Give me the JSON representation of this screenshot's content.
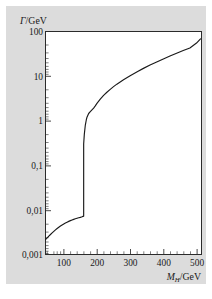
{
  "figure": {
    "background_color": "#ffffff",
    "panel_color": "#dcdcdc",
    "plot_area_color": "#ffffff",
    "ink_color": "#1a1a1a"
  },
  "chart_data": {
    "type": "line",
    "title": "",
    "subtitle": "",
    "xlabel": "M_H/GeV",
    "xlabel_parts": {
      "symbol": "M",
      "subscript": "H",
      "unit": "/GeV"
    },
    "ylabel": "Γ/GeV",
    "ylabel_parts": {
      "symbol": "Γ",
      "unit": "/GeV"
    },
    "xscale": "linear",
    "yscale": "log",
    "xlim": [
      45,
      515
    ],
    "ylim": [
      0.001,
      100
    ],
    "grid": false,
    "legend": null,
    "xticks": [
      100,
      200,
      300,
      400,
      500
    ],
    "xticklabels": [
      "100",
      "200",
      "300",
      "400",
      "500"
    ],
    "xminor_step": 20,
    "yticks": [
      0.001,
      0.01,
      0.1,
      1,
      10,
      100
    ],
    "yticklabels": [
      "0,001",
      "0,01",
      "0,1",
      "1",
      "10",
      "100"
    ],
    "series": [
      {
        "name": "Higgs total decay width",
        "color": "#1a1a1a",
        "x": [
          45,
          50,
          55,
          60,
          65,
          70,
          75,
          80,
          85,
          90,
          95,
          100,
          105,
          110,
          115,
          120,
          125,
          130,
          135,
          140,
          145,
          150,
          155,
          158,
          160,
          160,
          162,
          165,
          168,
          170,
          175,
          180,
          185,
          190,
          195,
          200,
          210,
          220,
          230,
          240,
          250,
          260,
          280,
          300,
          320,
          340,
          360,
          380,
          400,
          420,
          440,
          460,
          480,
          500,
          512
        ],
        "y": [
          0.00215,
          0.00235,
          0.00258,
          0.00281,
          0.00305,
          0.0033,
          0.00356,
          0.00382,
          0.00408,
          0.00434,
          0.00459,
          0.00484,
          0.00508,
          0.00531,
          0.00553,
          0.00574,
          0.00594,
          0.00613,
          0.00631,
          0.00648,
          0.00665,
          0.00681,
          0.007,
          0.00715,
          0.00725,
          0.3,
          0.5,
          0.8,
          1.05,
          1.2,
          1.45,
          1.6,
          1.75,
          1.92,
          2.15,
          2.45,
          3.05,
          3.7,
          4.35,
          5.05,
          5.8,
          6.6,
          8.3,
          10.2,
          12.4,
          14.9,
          17.7,
          20.8,
          24.3,
          28.2,
          32.6,
          37.4,
          42.8,
          55.0,
          68.0
        ],
        "note": "sharp vertical jump at the WW threshold near 160 GeV"
      }
    ],
    "annotations": []
  }
}
